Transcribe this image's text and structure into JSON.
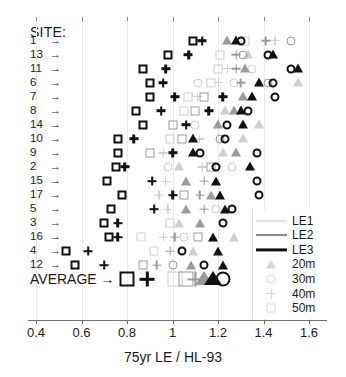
{
  "axis_title": "75yr LE / HL-93",
  "site_header": "SITE:",
  "average_label": "AVERAGE",
  "arrow_glyph": "→",
  "x_ticks": [
    {
      "value": 0.4,
      "label": "0.4"
    },
    {
      "value": 0.6,
      "label": "0.6"
    },
    {
      "value": 0.8,
      "label": "0.8"
    },
    {
      "value": 1.0,
      "label": "1"
    },
    {
      "value": 1.2,
      "label": "1.2"
    },
    {
      "value": 1.4,
      "label": "1.4"
    },
    {
      "value": 1.6,
      "label": "1.6"
    }
  ],
  "legend": {
    "entries": [
      {
        "label": "LE1",
        "kind": "line",
        "color": "#c8c8c8",
        "weight": 1
      },
      {
        "label": "LE2",
        "kind": "line",
        "color": "#8c8c8c",
        "weight": 2
      },
      {
        "label": "LE3",
        "kind": "line",
        "color": "#111111",
        "weight": 3.2
      },
      {
        "label": "20m",
        "kind": "marker",
        "shape": "triangle",
        "color": "#d8d8d8"
      },
      {
        "label": "30m",
        "kind": "marker",
        "shape": "circle",
        "color": "#dcdcdc"
      },
      {
        "label": "40m",
        "kind": "marker",
        "shape": "plus",
        "color": "#d2d2d2"
      },
      {
        "label": "50m",
        "kind": "marker",
        "shape": "square",
        "color": "#dcdcdc"
      }
    ]
  },
  "colors": {
    "le1": "#cfcfcf",
    "le2": "#9a9a9a",
    "le3": "#111111",
    "grid": "#e9e9e9",
    "axis": "#6e6e6e",
    "text": "#1a1a1a"
  },
  "chart_data": {
    "type": "scatter",
    "title": "",
    "xlabel": "75yr LE / HL-93",
    "ylabel": "SITE:",
    "xlim": [
      0.33,
      1.65
    ],
    "grid": true,
    "legend_position": "right",
    "series_levels": [
      "LE1",
      "LE2",
      "LE3"
    ],
    "span_lengths": [
      "20m",
      "30m",
      "40m",
      "50m"
    ],
    "marker_by_span": {
      "20m": "triangle",
      "30m": "circle",
      "40m": "plus",
      "50m": "square"
    },
    "shade_by_level": {
      "LE1": "#cfcfcf",
      "LE2": "#9a9a9a",
      "LE3": "#111111"
    },
    "categories": [
      "1",
      "13",
      "11",
      "6",
      "7",
      "8",
      "14",
      "10",
      "9",
      "2",
      "15",
      "17",
      "5",
      "3",
      "16",
      "4",
      "12",
      "AVERAGE"
    ],
    "rows": [
      {
        "site": "1",
        "points": [
          {
            "x": 1.09,
            "level": "LE3",
            "span": "50m"
          },
          {
            "x": 1.13,
            "level": "LE3",
            "span": "40m"
          },
          {
            "x": 1.24,
            "level": "LE2",
            "span": "20m"
          },
          {
            "x": 1.28,
            "level": "LE3",
            "span": "20m"
          },
          {
            "x": 1.3,
            "level": "LE3",
            "span": "30m"
          },
          {
            "x": 1.32,
            "level": "LE1",
            "span": "50m"
          },
          {
            "x": 1.41,
            "level": "LE2",
            "span": "40m"
          },
          {
            "x": 1.45,
            "level": "LE1",
            "span": "40m"
          },
          {
            "x": 1.52,
            "level": "LE2",
            "span": "30m"
          }
        ]
      },
      {
        "site": "13",
        "points": [
          {
            "x": 0.98,
            "level": "LE3",
            "span": "50m"
          },
          {
            "x": 1.07,
            "level": "LE3",
            "span": "40m"
          },
          {
            "x": 1.21,
            "level": "LE1",
            "span": "50m"
          },
          {
            "x": 1.28,
            "level": "LE2",
            "span": "40m"
          },
          {
            "x": 1.31,
            "level": "LE2",
            "span": "30m"
          },
          {
            "x": 1.33,
            "level": "LE1",
            "span": "20m"
          },
          {
            "x": 1.42,
            "level": "LE3",
            "span": "30m"
          },
          {
            "x": 1.44,
            "level": "LE3",
            "span": "20m"
          }
        ]
      },
      {
        "site": "11",
        "points": [
          {
            "x": 0.87,
            "level": "LE3",
            "span": "50m"
          },
          {
            "x": 0.97,
            "level": "LE3",
            "span": "40m"
          },
          {
            "x": 1.2,
            "level": "LE1",
            "span": "50m"
          },
          {
            "x": 1.24,
            "level": "LE1",
            "span": "40m"
          },
          {
            "x": 1.28,
            "level": "LE2",
            "span": "40m"
          },
          {
            "x": 1.32,
            "level": "LE2",
            "span": "20m"
          },
          {
            "x": 1.35,
            "level": "LE1",
            "span": "30m"
          },
          {
            "x": 1.52,
            "level": "LE3",
            "span": "30m"
          },
          {
            "x": 1.55,
            "level": "LE3",
            "span": "20m"
          }
        ]
      },
      {
        "site": "6",
        "points": [
          {
            "x": 0.9,
            "level": "LE3",
            "span": "50m"
          },
          {
            "x": 0.96,
            "level": "LE3",
            "span": "40m"
          },
          {
            "x": 1.11,
            "level": "LE1",
            "span": "30m"
          },
          {
            "x": 1.17,
            "level": "LE1",
            "span": "50m"
          },
          {
            "x": 1.2,
            "level": "LE1",
            "span": "40m"
          },
          {
            "x": 1.27,
            "level": "LE1",
            "span": "30m"
          },
          {
            "x": 1.3,
            "level": "LE2",
            "span": "40m"
          },
          {
            "x": 1.38,
            "level": "LE3",
            "span": "20m"
          },
          {
            "x": 1.42,
            "level": "LE2",
            "span": "30m"
          },
          {
            "x": 1.44,
            "level": "LE3",
            "span": "30m"
          },
          {
            "x": 1.55,
            "level": "LE1",
            "span": "20m"
          }
        ]
      },
      {
        "site": "7",
        "points": [
          {
            "x": 0.9,
            "level": "LE3",
            "span": "50m"
          },
          {
            "x": 1.01,
            "level": "LE3",
            "span": "40m"
          },
          {
            "x": 1.07,
            "level": "LE1",
            "span": "50m"
          },
          {
            "x": 1.11,
            "level": "LE1",
            "span": "40m"
          },
          {
            "x": 1.14,
            "level": "LE2",
            "span": "50m"
          },
          {
            "x": 1.22,
            "level": "LE3",
            "span": "40m"
          },
          {
            "x": 1.31,
            "level": "LE2",
            "span": "20m"
          },
          {
            "x": 1.35,
            "level": "LE3",
            "span": "20m"
          },
          {
            "x": 1.45,
            "level": "LE3",
            "span": "30m"
          }
        ]
      },
      {
        "site": "8",
        "points": [
          {
            "x": 0.84,
            "level": "LE3",
            "span": "50m"
          },
          {
            "x": 0.95,
            "level": "LE3",
            "span": "40m"
          },
          {
            "x": 1.05,
            "level": "LE1",
            "span": "50m"
          },
          {
            "x": 1.1,
            "level": "LE2",
            "span": "50m"
          },
          {
            "x": 1.16,
            "level": "LE3",
            "span": "40m"
          },
          {
            "x": 1.23,
            "level": "LE1",
            "span": "20m"
          },
          {
            "x": 1.27,
            "level": "LE2",
            "span": "20m"
          },
          {
            "x": 1.3,
            "level": "LE3",
            "span": "20m"
          },
          {
            "x": 1.33,
            "level": "LE3",
            "span": "30m"
          }
        ]
      },
      {
        "site": "14",
        "points": [
          {
            "x": 0.87,
            "level": "LE3",
            "span": "50m"
          },
          {
            "x": 1.0,
            "level": "LE2",
            "span": "50m"
          },
          {
            "x": 1.06,
            "level": "LE3",
            "span": "40m"
          },
          {
            "x": 1.1,
            "level": "LE1",
            "span": "30m"
          },
          {
            "x": 1.2,
            "level": "LE2",
            "span": "20m"
          },
          {
            "x": 1.24,
            "level": "LE3",
            "span": "30m"
          },
          {
            "x": 1.31,
            "level": "LE3",
            "span": "20m"
          },
          {
            "x": 1.38,
            "level": "LE1",
            "span": "20m"
          }
        ]
      },
      {
        "site": "10",
        "points": [
          {
            "x": 0.76,
            "level": "LE3",
            "span": "50m"
          },
          {
            "x": 0.83,
            "level": "LE3",
            "span": "40m"
          },
          {
            "x": 0.99,
            "level": "LE1",
            "span": "50m"
          },
          {
            "x": 1.04,
            "level": "LE2",
            "span": "50m"
          },
          {
            "x": 1.09,
            "level": "LE3",
            "span": "20m"
          },
          {
            "x": 1.12,
            "level": "LE1",
            "span": "40m"
          },
          {
            "x": 1.21,
            "level": "LE2",
            "span": "30m"
          },
          {
            "x": 1.23,
            "level": "LE3",
            "span": "30m"
          },
          {
            "x": 1.31,
            "level": "LE1",
            "span": "20m"
          }
        ]
      },
      {
        "site": "9",
        "points": [
          {
            "x": 0.76,
            "level": "LE3",
            "span": "50m"
          },
          {
            "x": 0.9,
            "level": "LE2",
            "span": "50m"
          },
          {
            "x": 0.96,
            "level": "LE1",
            "span": "40m"
          },
          {
            "x": 1.0,
            "level": "LE3",
            "span": "40m"
          },
          {
            "x": 1.09,
            "level": "LE3",
            "span": "20m"
          },
          {
            "x": 1.12,
            "level": "LE3",
            "span": "30m"
          },
          {
            "x": 1.22,
            "level": "LE1",
            "span": "20m"
          },
          {
            "x": 1.28,
            "level": "LE2",
            "span": "20m"
          },
          {
            "x": 1.37,
            "level": "LE3",
            "span": "30m"
          }
        ]
      },
      {
        "site": "2",
        "points": [
          {
            "x": 0.75,
            "level": "LE3",
            "span": "50m"
          },
          {
            "x": 0.79,
            "level": "LE3",
            "span": "40m"
          },
          {
            "x": 0.98,
            "level": "LE1",
            "span": "30m"
          },
          {
            "x": 1.03,
            "level": "LE1",
            "span": "20m"
          },
          {
            "x": 1.13,
            "level": "LE1",
            "span": "40m"
          },
          {
            "x": 1.17,
            "level": "LE2",
            "span": "50m"
          },
          {
            "x": 1.19,
            "level": "LE3",
            "span": "30m"
          },
          {
            "x": 1.26,
            "level": "LE1",
            "span": "30m"
          },
          {
            "x": 1.34,
            "level": "LE3",
            "span": "20m"
          }
        ]
      },
      {
        "site": "15",
        "points": [
          {
            "x": 0.71,
            "level": "LE3",
            "span": "50m"
          },
          {
            "x": 0.91,
            "level": "LE3",
            "span": "40m"
          },
          {
            "x": 0.97,
            "level": "LE1",
            "span": "40m"
          },
          {
            "x": 1.06,
            "level": "LE2",
            "span": "20m"
          },
          {
            "x": 1.14,
            "level": "LE2",
            "span": "40m"
          },
          {
            "x": 1.19,
            "level": "LE3",
            "span": "20m"
          },
          {
            "x": 1.37,
            "level": "LE3",
            "span": "30m"
          }
        ]
      },
      {
        "site": "17",
        "points": [
          {
            "x": 0.78,
            "level": "LE3",
            "span": "50m"
          },
          {
            "x": 0.94,
            "level": "LE1",
            "span": "40m"
          },
          {
            "x": 1.0,
            "level": "LE3",
            "span": "40m"
          },
          {
            "x": 1.05,
            "level": "LE2",
            "span": "50m"
          },
          {
            "x": 1.12,
            "level": "LE2",
            "span": "40m"
          },
          {
            "x": 1.17,
            "level": "LE2",
            "span": "20m"
          },
          {
            "x": 1.21,
            "level": "LE3",
            "span": "20m"
          },
          {
            "x": 1.38,
            "level": "LE3",
            "span": "30m"
          }
        ]
      },
      {
        "site": "5",
        "points": [
          {
            "x": 0.73,
            "level": "LE3",
            "span": "50m"
          },
          {
            "x": 0.92,
            "level": "LE3",
            "span": "40m"
          },
          {
            "x": 0.98,
            "level": "LE1",
            "span": "40m"
          },
          {
            "x": 1.06,
            "level": "LE2",
            "span": "20m"
          },
          {
            "x": 1.14,
            "level": "LE2",
            "span": "40m"
          },
          {
            "x": 1.19,
            "level": "LE1",
            "span": "30m"
          },
          {
            "x": 1.23,
            "level": "LE3",
            "span": "20m"
          },
          {
            "x": 1.26,
            "level": "LE3",
            "span": "30m"
          }
        ]
      },
      {
        "site": "3",
        "points": [
          {
            "x": 0.7,
            "level": "LE3",
            "span": "50m"
          },
          {
            "x": 0.76,
            "level": "LE3",
            "span": "40m"
          },
          {
            "x": 0.99,
            "level": "LE1",
            "span": "50m"
          },
          {
            "x": 1.03,
            "level": "LE1",
            "span": "20m"
          },
          {
            "x": 1.12,
            "level": "LE2",
            "span": "20m"
          },
          {
            "x": 1.22,
            "level": "LE3",
            "span": "30m"
          }
        ]
      },
      {
        "site": "16",
        "points": [
          {
            "x": 0.72,
            "level": "LE3",
            "span": "50m"
          },
          {
            "x": 0.76,
            "level": "LE3",
            "span": "40m"
          },
          {
            "x": 0.86,
            "level": "LE1",
            "span": "50m"
          },
          {
            "x": 0.96,
            "level": "LE1",
            "span": "40m"
          },
          {
            "x": 1.01,
            "level": "LE2",
            "span": "40m"
          },
          {
            "x": 1.05,
            "level": "LE1",
            "span": "30m"
          },
          {
            "x": 1.11,
            "level": "LE2",
            "span": "50m"
          },
          {
            "x": 1.18,
            "level": "LE3",
            "span": "20m"
          },
          {
            "x": 1.27,
            "level": "LE1",
            "span": "20m"
          }
        ]
      },
      {
        "site": "4",
        "points": [
          {
            "x": 0.53,
            "level": "LE3",
            "span": "50m"
          },
          {
            "x": 0.63,
            "level": "LE3",
            "span": "40m"
          },
          {
            "x": 0.92,
            "level": "LE1",
            "span": "50m"
          },
          {
            "x": 0.99,
            "level": "LE2",
            "span": "40m"
          },
          {
            "x": 1.04,
            "level": "LE3",
            "span": "30m"
          },
          {
            "x": 1.09,
            "level": "LE1",
            "span": "20m"
          },
          {
            "x": 1.2,
            "level": "LE3",
            "span": "20m"
          }
        ]
      },
      {
        "site": "12",
        "points": [
          {
            "x": 0.57,
            "level": "LE3",
            "span": "50m"
          },
          {
            "x": 0.7,
            "level": "LE3",
            "span": "40m"
          },
          {
            "x": 0.87,
            "level": "LE2",
            "span": "50m"
          },
          {
            "x": 0.93,
            "level": "LE2",
            "span": "40m"
          },
          {
            "x": 1.0,
            "level": "LE2",
            "span": "30m"
          },
          {
            "x": 1.08,
            "level": "LE2",
            "span": "20m"
          },
          {
            "x": 1.14,
            "level": "LE3",
            "span": "30m"
          },
          {
            "x": 1.22,
            "level": "LE3",
            "span": "20m"
          }
        ]
      },
      {
        "site": "AVERAGE",
        "big": true,
        "points": [
          {
            "x": 0.8,
            "level": "LE3",
            "span": "50m"
          },
          {
            "x": 0.89,
            "level": "LE3",
            "span": "40m"
          },
          {
            "x": 1.01,
            "level": "LE1",
            "span": "50m"
          },
          {
            "x": 1.06,
            "level": "LE2",
            "span": "50m"
          },
          {
            "x": 1.1,
            "level": "LE2",
            "span": "40m"
          },
          {
            "x": 1.14,
            "level": "LE2",
            "span": "20m"
          },
          {
            "x": 1.18,
            "level": "LE3",
            "span": "20m"
          },
          {
            "x": 1.22,
            "level": "LE3",
            "span": "30m"
          }
        ]
      }
    ]
  }
}
